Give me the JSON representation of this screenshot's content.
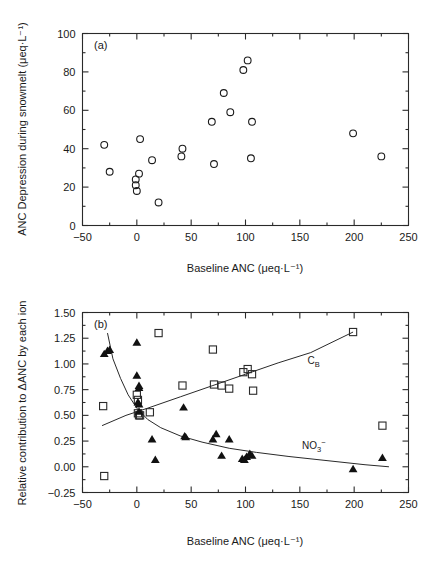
{
  "figure": {
    "background": "#ffffff",
    "ink_color": "#1a1a1a",
    "width": 441,
    "height": 570
  },
  "chart_data": [
    {
      "type": "scatter",
      "panel": "a",
      "panel_label": "(a)",
      "title": "",
      "xlabel": "Baseline ANC  (μeq·L⁻¹)",
      "ylabel": "ANC Depression during snowmelt  (μeq·L⁻¹)",
      "xlim": [
        -50,
        250
      ],
      "ylim": [
        0,
        100
      ],
      "xticks": [
        -50,
        0,
        50,
        100,
        150,
        200,
        250
      ],
      "xtick_labels": [
        "-50",
        "0",
        "50",
        "100",
        "150",
        "200",
        "250"
      ],
      "yticks": [
        0,
        20,
        40,
        60,
        80,
        100
      ],
      "ytick_labels": [
        "0",
        "20",
        "40",
        "60",
        "80",
        "100"
      ],
      "x_minor_ticks": [
        -25,
        25,
        75,
        125,
        175,
        225
      ],
      "y_minor_ticks": [
        10,
        30,
        50,
        70,
        90
      ],
      "grid": false,
      "legend": "none",
      "series": [
        {
          "name": "ANC depression",
          "marker": "open-circle",
          "points": [
            {
              "x": -30,
              "y": 42
            },
            {
              "x": -25,
              "y": 28
            },
            {
              "x": -1,
              "y": 24
            },
            {
              "x": -1,
              "y": 21
            },
            {
              "x": 0,
              "y": 18
            },
            {
              "x": 2,
              "y": 27
            },
            {
              "x": 3,
              "y": 45
            },
            {
              "x": 14,
              "y": 34
            },
            {
              "x": 20,
              "y": 12
            },
            {
              "x": 42,
              "y": 40
            },
            {
              "x": 41,
              "y": 36
            },
            {
              "x": 69,
              "y": 54
            },
            {
              "x": 71,
              "y": 32
            },
            {
              "x": 80,
              "y": 69
            },
            {
              "x": 86,
              "y": 59
            },
            {
              "x": 98,
              "y": 81
            },
            {
              "x": 102,
              "y": 86
            },
            {
              "x": 106,
              "y": 54
            },
            {
              "x": 105,
              "y": 35
            },
            {
              "x": 199,
              "y": 48
            },
            {
              "x": 225,
              "y": 36
            }
          ]
        }
      ]
    },
    {
      "type": "scatter",
      "panel": "b",
      "panel_label": "(b)",
      "title": "",
      "xlabel": "Baseline ANC  (μeq·L⁻¹)",
      "ylabel": "Relative contribution to ΔANC by each ion",
      "xlim": [
        -50,
        250
      ],
      "ylim": [
        -0.25,
        1.5
      ],
      "xticks": [
        -50,
        0,
        50,
        100,
        150,
        200,
        250
      ],
      "xtick_labels": [
        "-50",
        "0",
        "50",
        "100",
        "150",
        "200",
        "250"
      ],
      "yticks": [
        -0.25,
        0,
        0.25,
        0.5,
        0.75,
        1.0,
        1.25,
        1.5
      ],
      "ytick_labels": [
        "-0.25",
        "0.00",
        "0.25",
        "0.50",
        "0.75",
        "1.00",
        "1.25",
        "1.50"
      ],
      "x_minor_ticks": [
        -25,
        25,
        75,
        125,
        175,
        225
      ],
      "y_minor_ticks": [
        -0.125,
        0.125,
        0.375,
        0.625,
        0.875,
        1.125,
        1.375
      ],
      "grid": false,
      "legend": "inline-curve-labels",
      "annotations": [
        {
          "text": "C",
          "sub": "B",
          "x": 157,
          "y": 1.0,
          "name": "cb-curve-label"
        },
        {
          "text": "NO",
          "sub": "3",
          "sup": "−",
          "x": 152,
          "y": 0.17,
          "name": "no3-curve-label"
        }
      ],
      "series": [
        {
          "name": "C_B",
          "marker": "open-square",
          "points": [
            {
              "x": -31,
              "y": 0.59
            },
            {
              "x": -30,
              "y": -0.09
            },
            {
              "x": 0,
              "y": 0.7
            },
            {
              "x": 1,
              "y": 0.65
            },
            {
              "x": 1,
              "y": 0.52
            },
            {
              "x": 2,
              "y": 0.5
            },
            {
              "x": 3,
              "y": 0.5
            },
            {
              "x": 12,
              "y": 0.53
            },
            {
              "x": 20,
              "y": 1.3
            },
            {
              "x": 42,
              "y": 0.79
            },
            {
              "x": 70,
              "y": 1.14
            },
            {
              "x": 71,
              "y": 0.8
            },
            {
              "x": 78,
              "y": 0.79
            },
            {
              "x": 85,
              "y": 0.76
            },
            {
              "x": 98,
              "y": 0.92
            },
            {
              "x": 102,
              "y": 0.95
            },
            {
              "x": 106,
              "y": 0.9
            },
            {
              "x": 107,
              "y": 0.74
            },
            {
              "x": 199,
              "y": 1.31
            },
            {
              "x": 226,
              "y": 0.4
            }
          ]
        },
        {
          "name": "NO3-",
          "marker": "filled-triangle",
          "points": [
            {
              "x": -30,
              "y": 1.1
            },
            {
              "x": -27,
              "y": 1.13
            },
            {
              "x": -25,
              "y": 1.14
            },
            {
              "x": 0,
              "y": 1.21
            },
            {
              "x": 0,
              "y": 0.89
            },
            {
              "x": 2,
              "y": 0.79
            },
            {
              "x": 2,
              "y": 0.77
            },
            {
              "x": 1,
              "y": 0.63
            },
            {
              "x": 2,
              "y": 0.61
            },
            {
              "x": 2,
              "y": 0.54
            },
            {
              "x": 14,
              "y": 0.27
            },
            {
              "x": 17,
              "y": 0.07
            },
            {
              "x": 43,
              "y": 0.58
            },
            {
              "x": 44,
              "y": 0.3
            },
            {
              "x": 45,
              "y": 0.29
            },
            {
              "x": 70,
              "y": 0.27
            },
            {
              "x": 73,
              "y": 0.32
            },
            {
              "x": 78,
              "y": 0.11
            },
            {
              "x": 85,
              "y": 0.27
            },
            {
              "x": 97,
              "y": 0.08
            },
            {
              "x": 99,
              "y": 0.07
            },
            {
              "x": 101,
              "y": 0.1
            },
            {
              "x": 104,
              "y": 0.13
            },
            {
              "x": 106,
              "y": 0.11
            },
            {
              "x": 199,
              "y": -0.02
            },
            {
              "x": 226,
              "y": 0.09
            }
          ]
        }
      ],
      "fit_curves": [
        {
          "name": "C_B-fit",
          "points": [
            {
              "x": -32,
              "y": 0.4
            },
            {
              "x": -10,
              "y": 0.5
            },
            {
              "x": 10,
              "y": 0.57
            },
            {
              "x": 40,
              "y": 0.68
            },
            {
              "x": 70,
              "y": 0.79
            },
            {
              "x": 100,
              "y": 0.9
            },
            {
              "x": 130,
              "y": 1.01
            },
            {
              "x": 160,
              "y": 1.11
            },
            {
              "x": 199,
              "y": 1.31
            }
          ]
        },
        {
          "name": "NO3-fit",
          "points": [
            {
              "x": -27,
              "y": 1.3
            },
            {
              "x": -22,
              "y": 1.05
            },
            {
              "x": -15,
              "y": 0.86
            },
            {
              "x": -8,
              "y": 0.7
            },
            {
              "x": 0,
              "y": 0.57
            },
            {
              "x": 10,
              "y": 0.46
            },
            {
              "x": 22,
              "y": 0.38
            },
            {
              "x": 40,
              "y": 0.3
            },
            {
              "x": 60,
              "y": 0.24
            },
            {
              "x": 85,
              "y": 0.18
            },
            {
              "x": 110,
              "y": 0.14
            },
            {
              "x": 140,
              "y": 0.1
            },
            {
              "x": 175,
              "y": 0.06
            },
            {
              "x": 210,
              "y": 0.02
            },
            {
              "x": 232,
              "y": 0.0
            }
          ]
        }
      ]
    }
  ]
}
